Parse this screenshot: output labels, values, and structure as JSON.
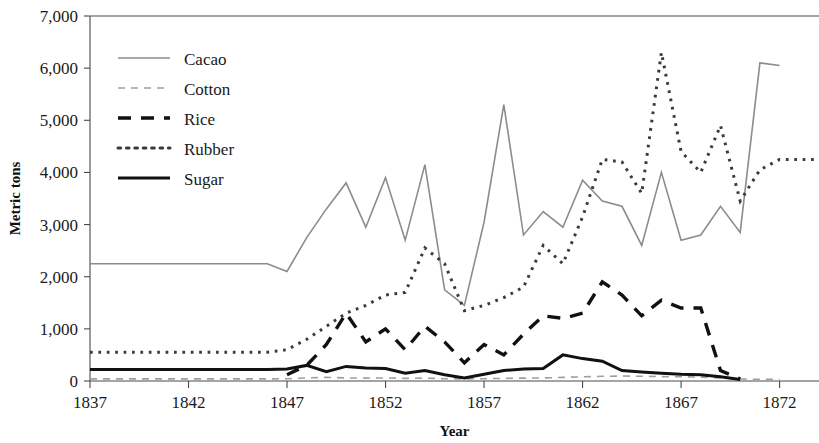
{
  "chart_data": {
    "type": "line",
    "title": "",
    "xlabel": "Year",
    "ylabel": "Metric tons",
    "xlim": [
      1837,
      1874
    ],
    "ylim": [
      0,
      7000
    ],
    "xticks": [
      1837,
      1842,
      1847,
      1852,
      1857,
      1862,
      1867,
      1872
    ],
    "xtick_labels": [
      "1837",
      "1842",
      "1847",
      "1852",
      "1857",
      "1862",
      "1867",
      "1872"
    ],
    "yticks": [
      0,
      1000,
      2000,
      3000,
      4000,
      5000,
      6000,
      7000
    ],
    "ytick_labels": [
      "0",
      "1,000",
      "2,000",
      "3,000",
      "4,000",
      "5,000",
      "6,000",
      "7,000"
    ],
    "grid": false,
    "legend_position": "upper-left-inside",
    "x": [
      1837,
      1838,
      1839,
      1840,
      1841,
      1842,
      1843,
      1844,
      1845,
      1846,
      1847,
      1848,
      1849,
      1850,
      1851,
      1852,
      1853,
      1854,
      1855,
      1856,
      1857,
      1858,
      1859,
      1860,
      1861,
      1862,
      1863,
      1864,
      1865,
      1866,
      1867,
      1868,
      1869,
      1870,
      1871,
      1872,
      1873,
      1874
    ],
    "series": [
      {
        "name": "Cacao",
        "color": "#8c8c8c",
        "dash": "solid",
        "width": 1.6,
        "values": [
          2250,
          2250,
          2250,
          2250,
          2250,
          2250,
          2250,
          2250,
          2250,
          2250,
          2100,
          2750,
          3300,
          3800,
          2950,
          3900,
          2700,
          4150,
          1750,
          1450,
          3050,
          5300,
          2800,
          3250,
          2950,
          3850,
          3450,
          3350,
          2600,
          4000,
          2700,
          2800,
          3350,
          2850,
          6100,
          6050,
          null,
          null
        ]
      },
      {
        "name": "Cotton",
        "color": "#9f9f9f",
        "dash": "dash-light",
        "width": 1.6,
        "values": [
          40,
          40,
          40,
          40,
          40,
          40,
          40,
          40,
          40,
          40,
          45,
          60,
          70,
          60,
          55,
          60,
          50,
          55,
          45,
          40,
          45,
          50,
          55,
          60,
          70,
          80,
          90,
          95,
          90,
          85,
          80,
          75,
          60,
          40,
          30,
          30,
          null,
          null
        ]
      },
      {
        "name": "Rice",
        "color": "#111111",
        "dash": "dash-heavy",
        "width": 3.4,
        "values": [
          null,
          null,
          null,
          null,
          null,
          null,
          null,
          null,
          null,
          null,
          120,
          300,
          700,
          1300,
          750,
          1000,
          600,
          1050,
          750,
          350,
          700,
          500,
          900,
          1250,
          1200,
          1300,
          1900,
          1650,
          1250,
          1550,
          1400,
          1400,
          200,
          40,
          null,
          null,
          null,
          null
        ]
      },
      {
        "name": "Rubber",
        "color": "#3a3a3a",
        "dash": "dot",
        "width": 3.0,
        "values": [
          550,
          550,
          550,
          550,
          550,
          550,
          550,
          550,
          550,
          550,
          600,
          800,
          1050,
          1300,
          1450,
          1650,
          1700,
          2550,
          2250,
          1350,
          1450,
          1600,
          1800,
          2600,
          2250,
          3150,
          4250,
          4200,
          3600,
          6300,
          4400,
          4000,
          4900,
          3450,
          4050,
          4250,
          4250,
          4250
        ]
      },
      {
        "name": "Sugar",
        "color": "#111111",
        "dash": "solid",
        "width": 3.0,
        "values": [
          220,
          220,
          220,
          220,
          220,
          220,
          220,
          220,
          220,
          220,
          230,
          300,
          180,
          280,
          250,
          240,
          150,
          200,
          120,
          60,
          130,
          200,
          230,
          240,
          500,
          430,
          380,
          200,
          170,
          150,
          130,
          120,
          80,
          30,
          null,
          null,
          null,
          null
        ]
      }
    ]
  },
  "legend": {
    "items": [
      {
        "label": "Cacao"
      },
      {
        "label": "Cotton"
      },
      {
        "label": "Rice"
      },
      {
        "label": "Rubber"
      },
      {
        "label": "Sugar"
      }
    ]
  }
}
